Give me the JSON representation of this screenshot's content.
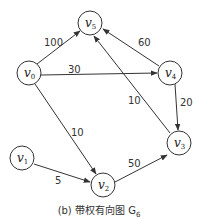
{
  "diagram": {
    "caption": "(b) 带权有向图 G",
    "caption_sub": "6",
    "nodes": [
      {
        "id": "v0",
        "label": "v",
        "sub": "0",
        "x": 29,
        "y": 73
      },
      {
        "id": "v1",
        "label": "v",
        "sub": "1",
        "x": 22,
        "y": 158
      },
      {
        "id": "v2",
        "label": "v",
        "sub": "2",
        "x": 103,
        "y": 185
      },
      {
        "id": "v3",
        "label": "v",
        "sub": "3",
        "x": 179,
        "y": 143
      },
      {
        "id": "v4",
        "label": "v",
        "sub": "4",
        "x": 170,
        "y": 73
      },
      {
        "id": "v5",
        "label": "v",
        "sub": "5",
        "x": 90,
        "y": 23
      }
    ],
    "edges": [
      {
        "from": "v0",
        "to": "v5",
        "weight": "100"
      },
      {
        "from": "v0",
        "to": "v4",
        "weight": "30"
      },
      {
        "from": "v0",
        "to": "v2",
        "weight": "10"
      },
      {
        "from": "v4",
        "to": "v5",
        "weight": "60"
      },
      {
        "from": "v4",
        "to": "v3",
        "weight": "20"
      },
      {
        "from": "v3",
        "to": "v5",
        "weight": "10"
      },
      {
        "from": "v1",
        "to": "v2",
        "weight": "5"
      },
      {
        "from": "v2",
        "to": "v3",
        "weight": "50"
      }
    ]
  }
}
